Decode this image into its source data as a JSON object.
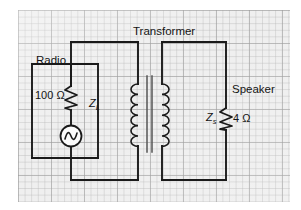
{
  "figure": {
    "type": "circuit-diagram",
    "background": "graph-paper",
    "colors": {
      "wire": "#1a1a1a",
      "grid_major": "#969696",
      "grid_minor": "#afafaf",
      "paper": "#eeeeee",
      "text": "#141414"
    }
  },
  "labels": {
    "transformer": "Transformer",
    "radio": "Radio",
    "speaker": "Speaker",
    "primary_resistance": "100 Ω",
    "secondary_resistance": "4 Ω",
    "load_impedance_symbol": "Z",
    "load_impedance_subscript": "L",
    "source_impedance_symbol": "Z",
    "source_impedance_subscript": "s"
  },
  "components": [
    {
      "id": "ac-source",
      "name": "ac-voltage-source",
      "icon": "sine-wave-in-circle",
      "side": "primary"
    },
    {
      "id": "r-primary",
      "name": "resistor-100-ohm",
      "icon": "zigzag-resistor",
      "value": "100 Ω",
      "side": "primary"
    },
    {
      "id": "transformer",
      "name": "iron-core-transformer",
      "icon": "dual-coil-with-core",
      "side": "center"
    },
    {
      "id": "r-secondary",
      "name": "resistor-4-ohm",
      "icon": "zigzag-resistor",
      "value": "4 Ω",
      "side": "secondary"
    }
  ]
}
